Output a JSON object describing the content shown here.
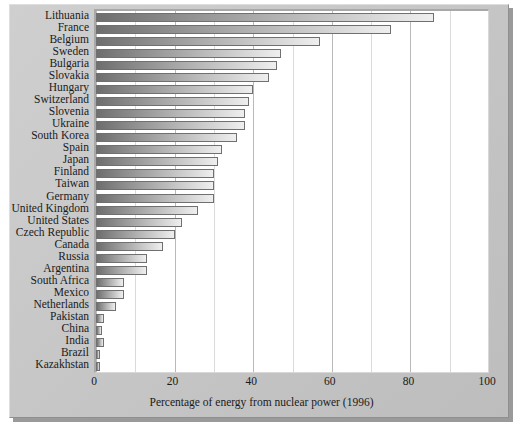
{
  "chart_data": {
    "type": "bar",
    "orientation": "horizontal",
    "title": "",
    "xlabel": "Percentage of energy from nuclear power (1996)",
    "ylabel": "",
    "xlim": [
      0,
      100
    ],
    "xticks": [
      0,
      20,
      40,
      60,
      80,
      100
    ],
    "minor_tick_step": 10,
    "grid": "vertical",
    "legend": "none",
    "categories": [
      "Lithuania",
      "France",
      "Belgium",
      "Sweden",
      "Bulgaria",
      "Slovakia",
      "Hungary",
      "Switzerland",
      "Slovenia",
      "Ukraine",
      "South Korea",
      "Spain",
      "Japan",
      "Finland",
      "Taiwan",
      "Germany",
      "United Kingdom",
      "United States",
      "Czech Republic",
      "Canada",
      "Russia",
      "Argentina",
      "South Africa",
      "Mexico",
      "Netherlands",
      "Pakistan",
      "China",
      "India",
      "Brazil",
      "Kazakhstan"
    ],
    "values": [
      86,
      75,
      57,
      47,
      46,
      44,
      40,
      39,
      38,
      38,
      36,
      32,
      31,
      30,
      30,
      30,
      26,
      22,
      20,
      17,
      13,
      13,
      7,
      7,
      5,
      2,
      1.4,
      2,
      1,
      0.5
    ]
  },
  "axis": {
    "xtitle": "Percentage of energy from nuclear power (1996)"
  },
  "colors": {
    "plate": "#c9c9c9",
    "plot_background": "#ffffff",
    "bar_dark": "#6e6e6e",
    "bar_light": "#efefef",
    "bar_border": "#707070",
    "gridline": "#b9b9b9",
    "text": "#1a1a1a"
  }
}
